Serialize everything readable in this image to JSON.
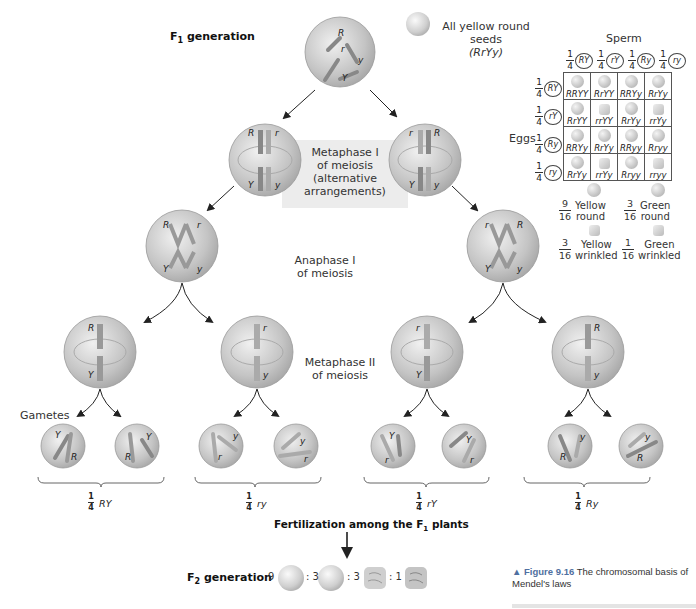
{
  "labels": {
    "f1_generation": "F",
    "f1_sub": "1",
    "f1_rest": " generation",
    "seeds_line1": "All yellow round seeds",
    "seeds_line2": "(RrYy)",
    "metaphase1_l1": "Metaphase I",
    "metaphase1_l2": "of meiosis",
    "metaphase1_l3": "(alternative",
    "metaphase1_l4": "arrangements)",
    "anaphase1_l1": "Anaphase I",
    "anaphase1_l2": "of meiosis",
    "metaphase2_l1": "Metaphase II",
    "metaphase2_l2": "of meiosis",
    "gametes": "Gametes",
    "fertilization": "Fertilization among the F",
    "fertilization_sub": "1",
    "fertilization_rest": " plants",
    "f2_generation": "F",
    "f2_sub": "2",
    "f2_rest": " generation"
  },
  "chromosome_alleles": {
    "top": [
      "R",
      "r",
      "y",
      "Y"
    ],
    "meta1_left": {
      "top": [
        "R",
        "r"
      ],
      "bottom": [
        "Y",
        "y"
      ]
    },
    "meta1_right": {
      "top": [
        "r",
        "R"
      ],
      "bottom": [
        "Y",
        "y"
      ]
    },
    "ana1_left": {
      "top": [
        "R",
        "r"
      ],
      "bottom": [
        "Y",
        "y"
      ]
    },
    "ana1_right": {
      "top": [
        "r",
        "R"
      ],
      "bottom": [
        "Y",
        "y"
      ]
    },
    "meta2": [
      {
        "top": "R",
        "bottom": "Y"
      },
      {
        "top": "r",
        "bottom": "y"
      },
      {
        "top": "r",
        "bottom": "Y"
      },
      {
        "top": "R",
        "bottom": "y"
      }
    ],
    "gametes": [
      [
        "Y",
        "R"
      ],
      [
        "Y",
        "R"
      ],
      [
        "y",
        "r"
      ],
      [
        "y",
        "r"
      ],
      [
        "Y",
        "r"
      ],
      [
        "Y",
        "r"
      ],
      [
        "y",
        "R"
      ],
      [
        "y",
        "R"
      ]
    ]
  },
  "gamete_groups": [
    {
      "num": "1",
      "den": "4",
      "genotype": "RY"
    },
    {
      "num": "1",
      "den": "4",
      "genotype": "ry"
    },
    {
      "num": "1",
      "den": "4",
      "genotype": "rY"
    },
    {
      "num": "1",
      "den": "4",
      "genotype": "Ry"
    }
  ],
  "punnett": {
    "sperm_label": "Sperm",
    "eggs_label": "Eggs",
    "sperm": [
      {
        "num": "1",
        "den": "4",
        "allele": "RY"
      },
      {
        "num": "1",
        "den": "4",
        "allele": "rY"
      },
      {
        "num": "1",
        "den": "4",
        "allele": "Ry"
      },
      {
        "num": "1",
        "den": "4",
        "allele": "ry"
      }
    ],
    "eggs": [
      {
        "num": "1",
        "den": "4",
        "allele": "RY"
      },
      {
        "num": "1",
        "den": "4",
        "allele": "rY"
      },
      {
        "num": "1",
        "den": "4",
        "allele": "Ry"
      },
      {
        "num": "1",
        "den": "4",
        "allele": "ry"
      }
    ],
    "cells": [
      [
        {
          "g": "RRYY",
          "w": false
        },
        {
          "g": "RrYY",
          "w": false
        },
        {
          "g": "RRYy",
          "w": false
        },
        {
          "g": "RrYy",
          "w": false
        }
      ],
      [
        {
          "g": "RrYY",
          "w": false
        },
        {
          "g": "rrYY",
          "w": true
        },
        {
          "g": "RrYy",
          "w": false
        },
        {
          "g": "rrYy",
          "w": true
        }
      ],
      [
        {
          "g": "RRYy",
          "w": false
        },
        {
          "g": "RrYy",
          "w": false
        },
        {
          "g": "RRyy",
          "w": false
        },
        {
          "g": "Rryy",
          "w": false
        }
      ],
      [
        {
          "g": "RrYy",
          "w": false
        },
        {
          "g": "rrYy",
          "w": true
        },
        {
          "g": "Rryy",
          "w": false
        },
        {
          "g": "rryy",
          "w": true
        }
      ]
    ],
    "legend": [
      {
        "num": "9",
        "den": "16",
        "l1": "Yellow",
        "l2": "round"
      },
      {
        "num": "3",
        "den": "16",
        "l1": "Green",
        "l2": "round"
      },
      {
        "num": "3",
        "den": "16",
        "l1": "Yellow",
        "l2": "wrinkled"
      },
      {
        "num": "1",
        "den": "16",
        "l1": "Green",
        "l2": "wrinkled"
      }
    ]
  },
  "f2_ratio": {
    "n1": "9",
    "sep1": ": 3",
    "sep2": ": 3",
    "sep3": ": 1"
  },
  "caption": {
    "fig": "▲ Figure 9.16",
    "text": "  The chromosomal basis of Mendel's laws"
  },
  "colors": {
    "cell_fill": "#c8c8c8",
    "box_fill": "#ececec",
    "caption_accent": "#4f6fa0"
  }
}
